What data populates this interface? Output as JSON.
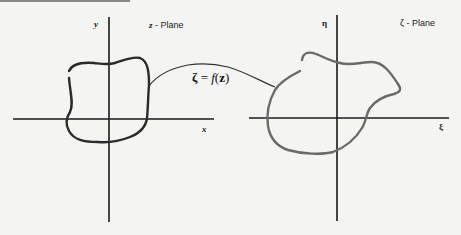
{
  "diagram": {
    "left_plane": {
      "title_var": "z",
      "title_suffix": " - Plane",
      "x_axis_label": "x",
      "y_axis_label": "y"
    },
    "right_plane": {
      "title_var": "ζ",
      "title_suffix": " - Plane",
      "x_axis_label": "ξ",
      "y_axis_label": "η"
    },
    "mapping": {
      "lhs": "ζ",
      "eq": " = ",
      "func": "f",
      "open": "(",
      "arg": "z",
      "close": ")"
    },
    "colors": {
      "axes": "#1a1a1a",
      "left_curve": "#2a2a2a",
      "right_curve": "#6a6a6a",
      "connector": "#333333",
      "background": "#f4f4f2"
    }
  }
}
